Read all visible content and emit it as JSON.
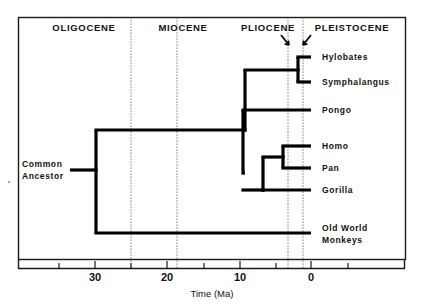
{
  "figure": {
    "title_axis": "Time (Ma)",
    "axis_unit": "Ma"
  },
  "epochs": [
    {
      "name": "OLIGOCENE",
      "label_x": 84,
      "start_ma": 35,
      "end_ma": 24
    },
    {
      "name": "MIOCENE",
      "label_x": 183,
      "start_ma": 24,
      "end_ma": 5.3
    },
    {
      "name": "PLIOCENE",
      "label_x": 268,
      "start_ma": 5.3,
      "end_ma": 1.8
    },
    {
      "name": "PLEISTOCENE",
      "label_x": 352,
      "start_ma": 1.8,
      "end_ma": 0
    }
  ],
  "epoch_boundaries_px": [
    131,
    177,
    288,
    303
  ],
  "axis": {
    "ticks": [
      {
        "label": "30",
        "ma": 30,
        "x": 95
      },
      {
        "label": "20",
        "ma": 20,
        "x": 167
      },
      {
        "label": "10",
        "ma": 10,
        "x": 240
      },
      {
        "label": "0",
        "ma": 0,
        "x": 311
      }
    ],
    "minor_ticks_px": [
      59,
      131,
      204,
      276,
      348
    ],
    "range_ma": [
      35.5,
      -5.5
    ]
  },
  "taxa": [
    {
      "name": "Hylobates",
      "tip_y": 57,
      "label_x": 322
    },
    {
      "name": "Symphalangus",
      "tip_y": 82,
      "label_x": 322
    },
    {
      "name": "Pongo",
      "tip_y": 110,
      "label_x": 322
    },
    {
      "name": "Homo",
      "tip_y": 146,
      "label_x": 322
    },
    {
      "name": "Pan",
      "tip_y": 168,
      "label_x": 322
    },
    {
      "name": "Gorilla",
      "tip_y": 190,
      "label_x": 322
    }
  ],
  "outgroup": {
    "line1": "Old World",
    "line2": "Monkeys",
    "tip_y": 233,
    "label_x": 322
  },
  "root": {
    "label_line1": "Common",
    "label_line2": "Ancestor",
    "label_x": 22,
    "label_y1": 164,
    "label_y2": 176,
    "node_x": 96,
    "stem_y": 170
  },
  "nodes": [
    {
      "id": "hylobatid-split",
      "x": 298,
      "ma": 1.8
    },
    {
      "id": "hominid-hylobatid-split",
      "x": 245,
      "ma": 9.2
    },
    {
      "id": "pongo-split",
      "x": 243,
      "ma": 9.5
    },
    {
      "id": "gorilla-split",
      "x": 263,
      "ma": 6.7
    },
    {
      "id": "homo-pan-split",
      "x": 283,
      "ma": 3.9
    },
    {
      "id": "catarrhine-root",
      "x": 96,
      "ma": 30.1
    }
  ],
  "colors": {
    "branch": "#000000",
    "frame": "#1a1a1a",
    "boundary": "#555555",
    "text": "#111111",
    "background": "#ffffff"
  }
}
